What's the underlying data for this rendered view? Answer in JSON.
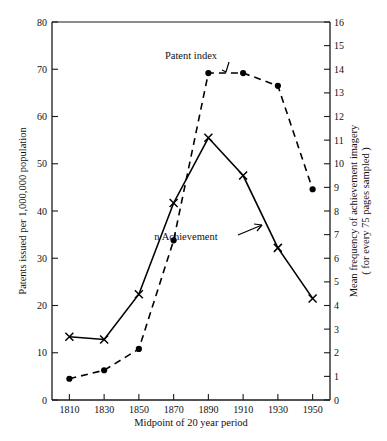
{
  "chart_data": {
    "type": "line",
    "title": "",
    "xlabel": "Midpoint of 20 year period",
    "ylabel": "Patents issued per 1,000,000 population",
    "y2label_line1": "Mean frequency of achievement imagery",
    "y2label_line2": "( for every 75 pages sampled )",
    "x": [
      1810,
      1830,
      1850,
      1870,
      1890,
      1910,
      1930,
      1950
    ],
    "xtick_labels": [
      "1810",
      "1830",
      "1850",
      "1870",
      "1890",
      "1910",
      "1930",
      "1950"
    ],
    "xlim": [
      1800,
      1960
    ],
    "ylim": [
      0,
      80
    ],
    "ytick_labels": [
      "0",
      "10",
      "20",
      "30",
      "40",
      "50",
      "60",
      "70",
      "80"
    ],
    "ytick_values": [
      0,
      10,
      20,
      30,
      40,
      50,
      60,
      70,
      80
    ],
    "y2lim": [
      0,
      16
    ],
    "y2tick_labels": [
      "0",
      "1",
      "2",
      "3",
      "4",
      "5",
      "6",
      "7",
      "8",
      "9",
      "10",
      "11",
      "12",
      "13",
      "14",
      "15",
      "16"
    ],
    "y2tick_values": [
      0,
      1,
      2,
      3,
      4,
      5,
      6,
      7,
      8,
      9,
      10,
      11,
      12,
      13,
      14,
      15,
      16
    ],
    "grid": false,
    "legend_position": "inline-annotations",
    "series": [
      {
        "name": "Patent index",
        "axis": "right",
        "marker": "filled-circle",
        "linestyle": "dashed",
        "values_right_axis": [
          0.9,
          1.25,
          2.15,
          6.7,
          13.8,
          13.8,
          13.3,
          8.9
        ],
        "values_left_axis": [
          4.5,
          6.3,
          10.8,
          33.8,
          69.2,
          69.2,
          66.5,
          44.6
        ]
      },
      {
        "name": "n Achievement",
        "axis": "left",
        "marker": "x",
        "linestyle": "solid",
        "values_left_axis": [
          13.4,
          12.8,
          22.4,
          41.7,
          55.5,
          47.5,
          32.2,
          21.5
        ],
        "values_right_axis": [
          2.6,
          2.5,
          4.4,
          8.2,
          11.0,
          9.4,
          6.3,
          4.1
        ]
      }
    ],
    "annotations": [
      {
        "text": "Patent index",
        "target_series": "Patent index",
        "arrow": "down"
      },
      {
        "text": "n Achievement",
        "target_series": "n Achievement",
        "arrow": "up-right"
      }
    ]
  }
}
